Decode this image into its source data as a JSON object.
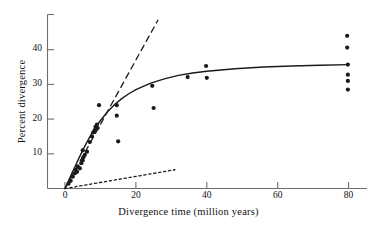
{
  "figure": {
    "background_color": "#ffffff",
    "ink_color": "#1a1a1a",
    "axis_color": "#6e6e6e"
  },
  "axes": {
    "x_title": "Divergence time (million years)",
    "y_title": "Percent divergence",
    "x_ticks": [
      {
        "value": 0,
        "label": "0"
      },
      {
        "value": 20,
        "label": "20"
      },
      {
        "value": 40,
        "label": "40"
      },
      {
        "value": 60,
        "label": "60"
      },
      {
        "value": 80,
        "label": "80"
      }
    ],
    "y_ticks": [
      {
        "value": 10,
        "label": "10"
      },
      {
        "value": 20,
        "label": "20"
      },
      {
        "value": 30,
        "label": "30"
      },
      {
        "value": 40,
        "label": "40"
      }
    ]
  },
  "chart_data": {
    "type": "scatter",
    "title": "",
    "subtitle": "",
    "xlabel": "Divergence time (million years)",
    "ylabel": "Percent divergence",
    "xlim": [
      0,
      85
    ],
    "ylim": [
      0,
      47.5
    ],
    "xticks": [
      0,
      20,
      40,
      60,
      80
    ],
    "yticks": [
      10,
      20,
      30,
      40
    ],
    "grid": false,
    "legend": "none",
    "marker": {
      "shape": "circle",
      "color": "#1a1a1a",
      "radius_px": 2.1
    },
    "points": [
      {
        "x": 1.0,
        "y": 1.4
      },
      {
        "x": 1.6,
        "y": 2.2
      },
      {
        "x": 2.2,
        "y": 3.4
      },
      {
        "x": 2.8,
        "y": 4.4
      },
      {
        "x": 3.0,
        "y": 5.4
      },
      {
        "x": 3.4,
        "y": 4.8
      },
      {
        "x": 3.6,
        "y": 6.3
      },
      {
        "x": 4.2,
        "y": 5.8
      },
      {
        "x": 4.6,
        "y": 7.3
      },
      {
        "x": 5.0,
        "y": 8.1
      },
      {
        "x": 5.2,
        "y": 9.0
      },
      {
        "x": 5.0,
        "y": 11.0
      },
      {
        "x": 5.6,
        "y": 9.7
      },
      {
        "x": 6.2,
        "y": 10.6
      },
      {
        "x": 7.0,
        "y": 13.4
      },
      {
        "x": 7.6,
        "y": 15.0
      },
      {
        "x": 8.0,
        "y": 16.2
      },
      {
        "x": 8.4,
        "y": 16.8
      },
      {
        "x": 8.6,
        "y": 17.8
      },
      {
        "x": 9.0,
        "y": 18.4
      },
      {
        "x": 9.2,
        "y": 17.4
      },
      {
        "x": 9.6,
        "y": 24.0
      },
      {
        "x": 14.6,
        "y": 24.0
      },
      {
        "x": 14.6,
        "y": 21.0
      },
      {
        "x": 15.0,
        "y": 13.6
      },
      {
        "x": 24.6,
        "y": 29.6
      },
      {
        "x": 25.0,
        "y": 23.2
      },
      {
        "x": 34.6,
        "y": 32.1
      },
      {
        "x": 39.8,
        "y": 35.3
      },
      {
        "x": 40.0,
        "y": 31.9
      },
      {
        "x": 79.6,
        "y": 44.0
      },
      {
        "x": 79.6,
        "y": 40.6
      },
      {
        "x": 79.8,
        "y": 35.7
      },
      {
        "x": 79.8,
        "y": 32.8
      },
      {
        "x": 79.8,
        "y": 31.0
      },
      {
        "x": 79.8,
        "y": 28.5
      }
    ],
    "curves": [
      {
        "name": "saturating-fit-curve",
        "style": "solid",
        "color": "#1a1a1a",
        "width_px": 1.4,
        "description": "Best-fit saturating curve rising steeply from origin and levelling near 35.7 percent at 80 million years",
        "points": [
          {
            "x": 0.0,
            "y": 0.0
          },
          {
            "x": 1.0,
            "y": 2.2
          },
          {
            "x": 2.0,
            "y": 4.5
          },
          {
            "x": 3.0,
            "y": 6.7
          },
          {
            "x": 4.0,
            "y": 8.9
          },
          {
            "x": 5.0,
            "y": 11.0
          },
          {
            "x": 6.0,
            "y": 13.0
          },
          {
            "x": 7.0,
            "y": 14.9
          },
          {
            "x": 8.0,
            "y": 16.6
          },
          {
            "x": 9.0,
            "y": 18.2
          },
          {
            "x": 10.0,
            "y": 19.6
          },
          {
            "x": 12.0,
            "y": 22.1
          },
          {
            "x": 14.0,
            "y": 24.2
          },
          {
            "x": 16.0,
            "y": 25.9
          },
          {
            "x": 18.0,
            "y": 27.3
          },
          {
            "x": 20.0,
            "y": 28.5
          },
          {
            "x": 24.0,
            "y": 30.3
          },
          {
            "x": 28.0,
            "y": 31.6
          },
          {
            "x": 32.0,
            "y": 32.6
          },
          {
            "x": 36.0,
            "y": 33.3
          },
          {
            "x": 40.0,
            "y": 33.8
          },
          {
            "x": 48.0,
            "y": 34.5
          },
          {
            "x": 56.0,
            "y": 35.0
          },
          {
            "x": 64.0,
            "y": 35.3
          },
          {
            "x": 72.0,
            "y": 35.5
          },
          {
            "x": 80.0,
            "y": 35.7
          }
        ]
      },
      {
        "name": "upper-reference-line",
        "style": "dashed",
        "color": "#1a1a1a",
        "width_px": 1.3,
        "description": "Steep dashed line of constant divergence rate extrapolated from the initial slope",
        "points": [
          {
            "x": 0.0,
            "y": 0.0
          },
          {
            "x": 26.2,
            "y": 48.5
          }
        ]
      },
      {
        "name": "lower-reference-line",
        "style": "dotted",
        "color": "#1a1a1a",
        "width_px": 1.3,
        "description": "Shallow dotted line showing the low apparent divergence rate over long time spans",
        "points": [
          {
            "x": 0.0,
            "y": 0.0
          },
          {
            "x": 31.0,
            "y": 5.4
          }
        ]
      }
    ]
  }
}
